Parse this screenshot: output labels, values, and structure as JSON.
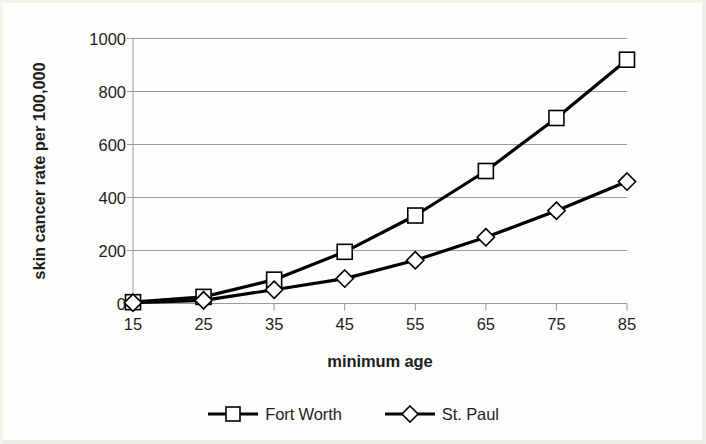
{
  "chart_data": {
    "type": "line",
    "title": "",
    "xlabel": "minimum age",
    "ylabel": "skin cancer rate per 100,000",
    "x": [
      15,
      25,
      35,
      45,
      55,
      65,
      75,
      85
    ],
    "xtick_labels": [
      "15",
      "25",
      "35",
      "45",
      "55",
      "65",
      "75",
      "85"
    ],
    "ytick_labels": [
      "0",
      "200",
      "400",
      "600",
      "800",
      "1000"
    ],
    "yticks": [
      0,
      200,
      400,
      600,
      800,
      1000
    ],
    "ylim": [
      0,
      1000
    ],
    "xlim": [
      15,
      85
    ],
    "grid": "horizontal",
    "legend_position": "bottom",
    "series": [
      {
        "name": "Fort Worth",
        "marker": "square",
        "color": "#000000",
        "values": [
          5,
          25,
          90,
          195,
          332,
          500,
          700,
          920
        ]
      },
      {
        "name": "St. Paul",
        "marker": "diamond",
        "color": "#000000",
        "values": [
          3,
          12,
          52,
          94,
          163,
          250,
          350,
          460
        ]
      }
    ]
  },
  "legend": {
    "entries": [
      {
        "label": "Fort Worth",
        "marker": "square"
      },
      {
        "label": "St. Paul",
        "marker": "diamond"
      }
    ]
  },
  "colors": {
    "line": "#000000",
    "gridline": "#9a9a9a",
    "axis": "#9a9a9a",
    "text": "#1d1d1d",
    "background": "#fdfdfc"
  }
}
